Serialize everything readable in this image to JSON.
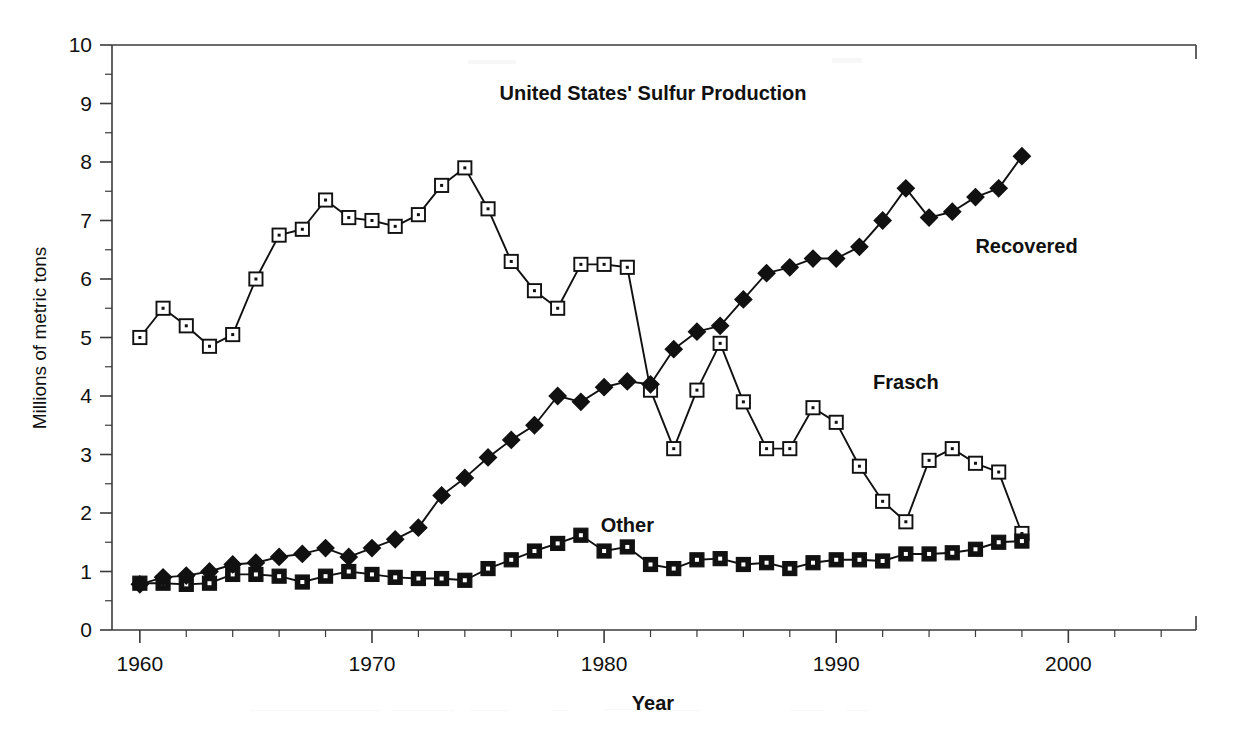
{
  "chart_data": {
    "type": "line",
    "title": "United States' Sulfur Production",
    "xlabel": "Year",
    "ylabel": "Millions of metric tons",
    "xlim": [
      1958.8,
      2005.5
    ],
    "ylim": [
      0,
      10
    ],
    "xticks": [
      1960,
      1970,
      1980,
      1990,
      2000
    ],
    "xtick_labels": [
      "1960",
      "1970",
      "1980",
      "1990",
      "2000"
    ],
    "x_minor_step": 2,
    "yticks": [
      0,
      1,
      2,
      3,
      4,
      5,
      6,
      7,
      8,
      9,
      10
    ],
    "ytick_labels": [
      "0",
      "1",
      "2",
      "3",
      "4",
      "5",
      "6",
      "7",
      "8",
      "9",
      "10"
    ],
    "y_minor_step": 0.5,
    "grid": false,
    "legend_position": "inline-annotations",
    "x": [
      1960,
      1961,
      1962,
      1963,
      1964,
      1965,
      1966,
      1967,
      1968,
      1969,
      1970,
      1971,
      1972,
      1973,
      1974,
      1975,
      1976,
      1977,
      1978,
      1979,
      1980,
      1981,
      1982,
      1983,
      1984,
      1985,
      1986,
      1987,
      1988,
      1989,
      1990,
      1991,
      1992,
      1993,
      1994,
      1995,
      1996,
      1997,
      1998
    ],
    "series": [
      {
        "name": "Frasch",
        "marker": "open-square-dot",
        "values": [
          5.0,
          5.5,
          5.2,
          4.85,
          5.05,
          6.0,
          6.75,
          6.85,
          7.35,
          7.05,
          7.0,
          6.9,
          7.1,
          7.6,
          7.9,
          7.2,
          6.3,
          5.8,
          5.5,
          6.25,
          6.25,
          6.2,
          4.1,
          3.1,
          4.1,
          4.9,
          3.9,
          3.1,
          3.1,
          3.8,
          3.55,
          2.8,
          2.2,
          1.85,
          2.9,
          3.1,
          2.85,
          2.7,
          1.65
        ]
      },
      {
        "name": "Recovered",
        "marker": "filled-diamond",
        "values": [
          0.78,
          0.9,
          0.93,
          1.0,
          1.12,
          1.15,
          1.25,
          1.3,
          1.4,
          1.25,
          1.4,
          1.55,
          1.75,
          2.3,
          2.6,
          2.95,
          3.25,
          3.5,
          4.0,
          3.9,
          4.15,
          4.25,
          4.2,
          4.8,
          5.1,
          5.2,
          5.65,
          6.1,
          6.2,
          6.35,
          6.35,
          6.55,
          7.0,
          7.55,
          7.05,
          7.15,
          7.4,
          7.55,
          8.1
        ]
      },
      {
        "name": "Other",
        "marker": "filled-square-dot",
        "values": [
          0.8,
          0.8,
          0.78,
          0.8,
          0.95,
          0.95,
          0.92,
          0.82,
          0.92,
          1.0,
          0.95,
          0.9,
          0.88,
          0.88,
          0.85,
          1.05,
          1.2,
          1.35,
          1.48,
          1.62,
          1.35,
          1.42,
          1.12,
          1.05,
          1.2,
          1.22,
          1.12,
          1.15,
          1.05,
          1.15,
          1.2,
          1.2,
          1.18,
          1.3,
          1.3,
          1.32,
          1.38,
          1.5,
          1.52
        ]
      }
    ],
    "annotations": [
      {
        "text": "Recovered",
        "x": 1998.2,
        "y": 6.45
      },
      {
        "text": "Frasch",
        "x": 1993.0,
        "y": 4.12
      },
      {
        "text": "Other",
        "x": 1981.0,
        "y": 1.68
      }
    ],
    "colors": {
      "ink": "#111111",
      "axis": "#3a3a3a",
      "background": "#ffffff",
      "marker_fill_open": "#ffffff",
      "marker_fill_solid": "#111111"
    }
  }
}
